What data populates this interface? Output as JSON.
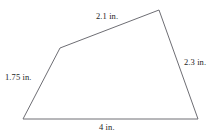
{
  "figure": {
    "type": "quadrilateral",
    "unit": "in.",
    "stroke_color": "#6e6e74",
    "background_color": "#ffffff",
    "stroke_width": 1,
    "vertices": [
      {
        "name": "bottom-left",
        "x": 23,
        "y": 119
      },
      {
        "name": "upper-left",
        "x": 60,
        "y": 48
      },
      {
        "name": "top-right",
        "x": 159,
        "y": 10
      },
      {
        "name": "bottom-right",
        "x": 198,
        "y": 119
      }
    ],
    "sides": [
      {
        "name": "top",
        "label": "2.1 in.",
        "value": 2.1,
        "from": "upper-left",
        "to": "top-right"
      },
      {
        "name": "right",
        "label": "2.3 in.",
        "value": 2.3,
        "from": "top-right",
        "to": "bottom-right"
      },
      {
        "name": "bottom",
        "label": "4 in.",
        "value": 4,
        "from": "bottom-right",
        "to": "bottom-left"
      },
      {
        "name": "left",
        "label": "1.75 in.",
        "value": 1.75,
        "from": "bottom-left",
        "to": "upper-left"
      }
    ]
  }
}
